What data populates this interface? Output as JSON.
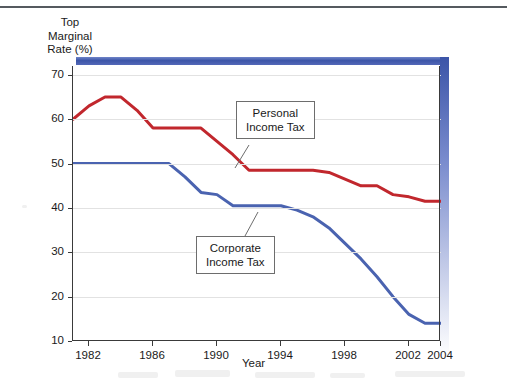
{
  "figure": {
    "y_axis_title": "Top\nMarginal\nRate (%)",
    "x_axis_title": "Year",
    "personal_callout": "Personal\nIncome Tax",
    "corporate_callout": "Corporate\nIncome Tax",
    "personal_color": "#c1272d",
    "corporate_color": "#4a63b0",
    "deco_bar_color": "#3c55a8",
    "grid_color": "#e2e2e2",
    "axis_color": "#3a3a3a"
  },
  "chart_data": {
    "type": "line",
    "title": "",
    "xlabel": "Year",
    "ylabel": "Top Marginal Rate (%)",
    "xlim": [
      1981,
      2004
    ],
    "ylim": [
      10,
      72
    ],
    "yticks": [
      10,
      20,
      30,
      40,
      50,
      60,
      70
    ],
    "xticks": [
      1982,
      1986,
      1990,
      1994,
      1998,
      2002,
      2004
    ],
    "grid": true,
    "legend": "callout-labels",
    "x": [
      1981,
      1982,
      1983,
      1984,
      1985,
      1986,
      1987,
      1988,
      1989,
      1990,
      1991,
      1992,
      1993,
      1994,
      1995,
      1996,
      1997,
      1998,
      1999,
      2000,
      2001,
      2002,
      2003,
      2004
    ],
    "series": [
      {
        "name": "Personal Income Tax",
        "color": "#c1272d",
        "values": [
          60.0,
          63.0,
          65.0,
          65.0,
          62.0,
          58.0,
          58.0,
          58.0,
          58.0,
          55.0,
          52.0,
          48.5,
          48.5,
          48.5,
          48.5,
          48.5,
          48.0,
          46.5,
          45.0,
          45.0,
          43.0,
          42.5,
          41.5,
          41.5
        ]
      },
      {
        "name": "Corporate Income Tax",
        "color": "#4a63b0",
        "values": [
          50.0,
          50.0,
          50.0,
          50.0,
          50.0,
          50.0,
          50.0,
          47.0,
          43.5,
          43.0,
          40.5,
          40.5,
          40.5,
          40.5,
          39.5,
          38.0,
          35.5,
          32.0,
          28.5,
          24.5,
          20.0,
          16.0,
          14.0,
          14.0
        ]
      }
    ]
  }
}
